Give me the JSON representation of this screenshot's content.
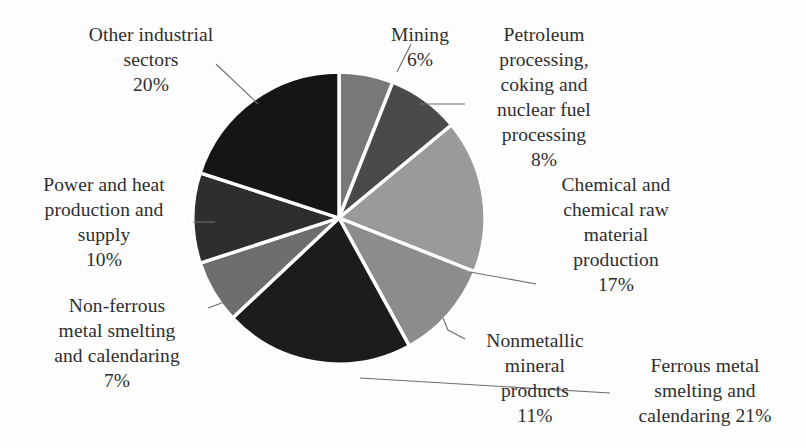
{
  "chart_data": {
    "type": "pie",
    "title": "",
    "categories": [
      "Mining",
      "Petroleum processing, coking and nuclear fuel processing",
      "Chemical and chemical raw material production",
      "Nonmetallic mineral products",
      "Ferrous metal smelting and calendaring",
      "Non-ferrous metal smelting and calendaring",
      "Power and heat production and supply",
      "Other industrial sectors"
    ],
    "values": [
      6,
      8,
      17,
      11,
      21,
      7,
      10,
      20
    ],
    "value_unit": "%",
    "start_angle_deg": 0,
    "direction": "clockwise",
    "legend": "none",
    "labels_position": "outside-with-leader-lines",
    "slice_colors": [
      "#787878",
      "#4a4a4a",
      "#9a9a9a",
      "#8c8c8c",
      "#1c1c1c",
      "#6e6e6e",
      "#2e2e2e",
      "#151515"
    ],
    "separator_color": "#ffffff"
  },
  "labels": {
    "other_industrial": {
      "text": "Other industrial\nsectors\n20%",
      "value": "20%",
      "name": "Other industrial sectors"
    },
    "mining": {
      "text": "Mining\n6%",
      "value": "6%",
      "name": "Mining"
    },
    "petroleum": {
      "text": "Petroleum\nprocessing,\ncoking and\nnuclear fuel\nprocessing\n8%",
      "value": "8%",
      "name": "Petroleum processing, coking and nuclear fuel processing"
    },
    "chemical": {
      "text": "Chemical and\nchemical raw\nmaterial\nproduction\n17%",
      "value": "17%",
      "name": "Chemical and chemical raw material production"
    },
    "power_heat": {
      "text": "Power and heat\nproduction and\nsupply\n10%",
      "value": "10%",
      "name": "Power and heat production and supply"
    },
    "non_ferrous": {
      "text": "Non-ferrous\nmetal smelting\nand calendaring\n7%",
      "value": "7%",
      "name": "Non-ferrous metal smelting and calendaring"
    },
    "nonmetallic": {
      "text": "Nonmetallic\nmineral\nproducts\n11%",
      "value": "11%",
      "name": "Nonmetallic mineral products"
    },
    "ferrous": {
      "text": "Ferrous metal\nsmelting and\ncalendaring 21%",
      "value": "21%",
      "name": "Ferrous metal smelting and calendaring"
    }
  },
  "geometry": {
    "center_x": 339,
    "center_y": 218,
    "radius": 146
  }
}
